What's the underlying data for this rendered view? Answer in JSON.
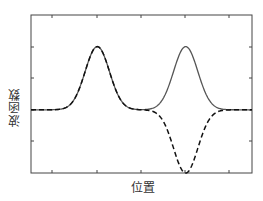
{
  "chart_data": {
    "type": "line",
    "title": "",
    "xlabel": "位置",
    "ylabel": "波函数",
    "grid": false,
    "legend": null,
    "x_tick_labels": [],
    "y_tick_labels": [],
    "x_range": [
      0,
      10
    ],
    "y_range": [
      -1,
      1.5
    ],
    "series": [
      {
        "name": "symmetric (solid)",
        "style": "solid",
        "color": "#555555",
        "description": "two positive Gaussian peaks of height 1 at x=3 and x=7",
        "peaks": [
          {
            "x": 3,
            "y": 1
          },
          {
            "x": 7,
            "y": 1
          }
        ]
      },
      {
        "name": "antisymmetric (dashed)",
        "style": "dashed",
        "color": "#111111",
        "description": "positive Gaussian peak at x=3, negative Gaussian trough at x=7",
        "peaks": [
          {
            "x": 3,
            "y": 1
          },
          {
            "x": 7,
            "y": -1
          }
        ]
      }
    ],
    "baseline": 0
  },
  "labels": {
    "x": "位置",
    "y": "波函数"
  }
}
